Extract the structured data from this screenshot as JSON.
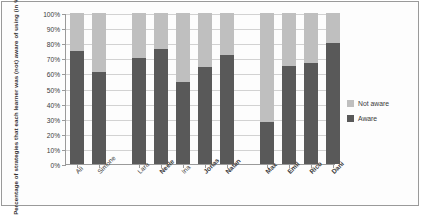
{
  "chart_data": {
    "type": "bar",
    "subtype": "stacked-100-percent",
    "title": "",
    "xlabel": "",
    "ylabel": "Percentage of strategies that each  learner was (not) aware of using  (in %)",
    "ylim": [
      0,
      100
    ],
    "ytick_labels": [
      "0%",
      "10%",
      "20%",
      "30%",
      "40%",
      "50%",
      "60%",
      "70%",
      "80%",
      "90%",
      "100%"
    ],
    "ytick_values": [
      0,
      10,
      20,
      30,
      40,
      50,
      60,
      70,
      80,
      90,
      100
    ],
    "grid": true,
    "legend_position": "right",
    "categories": [
      "Ali",
      "Simone",
      "Lara",
      "Neele",
      "Ina",
      "Jonas",
      "Natan",
      "Max",
      "Emil",
      "Rico",
      "Dani"
    ],
    "groups": [
      {
        "name": "group-1",
        "categories": [
          "Ali",
          "Simone"
        ]
      },
      {
        "name": "group-2",
        "categories": [
          "Lara",
          "Neele",
          "Ina",
          "Jonas",
          "Natan"
        ]
      },
      {
        "name": "group-3",
        "categories": [
          "Max",
          "Emil",
          "Rico",
          "Dani"
        ]
      }
    ],
    "series": [
      {
        "name": "Aware",
        "color": "#595959",
        "values": [
          75,
          61,
          70,
          76,
          54,
          64,
          72,
          28,
          65,
          67,
          80
        ]
      },
      {
        "name": "Not aware",
        "color": "#bfbfbf",
        "values": [
          25,
          39,
          30,
          24,
          46,
          36,
          28,
          72,
          35,
          33,
          20
        ]
      }
    ]
  },
  "legend": {
    "items": [
      {
        "label": "Not aware",
        "color": "#bfbfbf"
      },
      {
        "label": "Aware",
        "color": "#595959"
      }
    ]
  }
}
